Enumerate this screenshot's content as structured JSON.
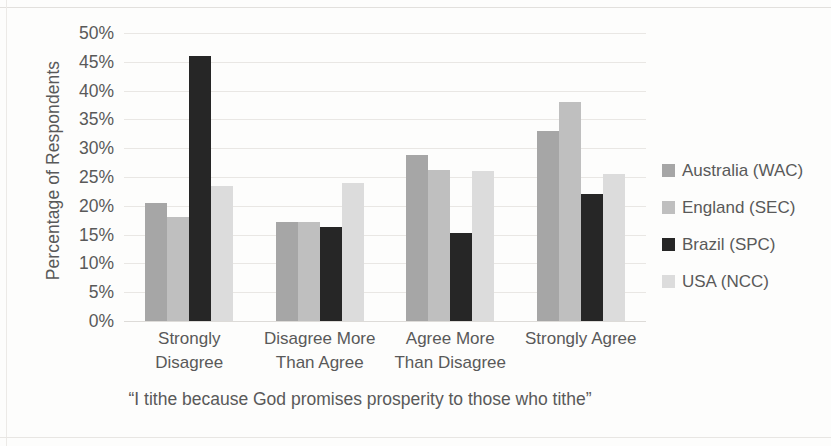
{
  "chart_data": {
    "type": "bar",
    "title": "",
    "xlabel": "“I tithe because God promises prosperity to those who tithe”",
    "ylabel": "Percentage of Respondents",
    "categories": [
      "Strongly Disagree",
      "Disagree More Than Agree",
      "Agree More Than Disagree",
      "Strongly Agree"
    ],
    "category_lines": [
      [
        "Strongly",
        "Disagree"
      ],
      [
        "Disagree More",
        "Than Agree"
      ],
      [
        "Agree More",
        "Than Disagree"
      ],
      [
        "Strongly Agree",
        ""
      ]
    ],
    "series": [
      {
        "name": "Australia (WAC)",
        "color": "#a6a6a6",
        "values": [
          20.5,
          17.2,
          28.8,
          33.0
        ]
      },
      {
        "name": "England (SEC)",
        "color": "#bfbfbf",
        "values": [
          18.0,
          17.2,
          26.3,
          38.0
        ]
      },
      {
        "name": "Brazil (SPC)",
        "color": "#262626",
        "values": [
          46.0,
          16.4,
          15.3,
          22.0
        ]
      },
      {
        "name": "USA (NCC)",
        "color": "#dcdcdc",
        "values": [
          23.5,
          24.0,
          26.0,
          25.5
        ]
      }
    ],
    "ylim": [
      0,
      50
    ],
    "ytick_values": [
      0,
      5,
      10,
      15,
      20,
      25,
      30,
      35,
      40,
      45,
      50
    ],
    "ytick_labels": [
      "0%",
      "5%",
      "10%",
      "15%",
      "20%",
      "25%",
      "30%",
      "35%",
      "40%",
      "45%",
      "50%"
    ],
    "grid": true,
    "legend_position": "right",
    "legend": [
      "Australia (WAC)",
      "England (SEC)",
      "Brazil (SPC)",
      "USA (NCC)"
    ]
  }
}
